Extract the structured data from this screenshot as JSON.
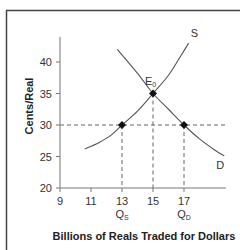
{
  "chart_data": {
    "type": "line",
    "title": "",
    "xlabel": "Billions of Reals Traded for Dollars",
    "ylabel": "Cents/Real",
    "xlim": [
      9,
      19.7
    ],
    "ylim": [
      20,
      44
    ],
    "x_ticks": [
      9,
      11,
      13,
      15,
      17
    ],
    "y_ticks": [
      20,
      25,
      30,
      35,
      40
    ],
    "grid": false,
    "series": [
      {
        "name": "S",
        "label": "S",
        "points": [
          [
            10.6,
            26.2
          ],
          [
            11.5,
            27.2
          ],
          [
            12.3,
            28.4
          ],
          [
            13,
            30
          ],
          [
            14,
            32.2
          ],
          [
            15,
            35
          ],
          [
            16,
            37.9
          ],
          [
            16.8,
            41
          ],
          [
            17.3,
            43
          ]
        ]
      },
      {
        "name": "D",
        "label": "D",
        "points": [
          [
            12.7,
            42
          ],
          [
            14,
            38.2
          ],
          [
            15,
            35
          ],
          [
            16,
            32.5
          ],
          [
            17,
            30
          ],
          [
            18,
            27.8
          ],
          [
            19,
            26
          ],
          [
            19.6,
            25.1
          ]
        ]
      }
    ],
    "annotations": [
      {
        "type": "point",
        "name": "equilibrium",
        "label": "E",
        "label_sub": "0",
        "x": 15,
        "y": 35
      },
      {
        "type": "point",
        "name": "quantity-supplied",
        "x": 13,
        "y": 30
      },
      {
        "type": "point",
        "name": "quantity-demanded",
        "x": 17,
        "y": 30
      },
      {
        "type": "hline",
        "y": 30,
        "style": "dashed"
      },
      {
        "type": "vline",
        "x": 13,
        "y_to": 30,
        "style": "dashed"
      },
      {
        "type": "vline",
        "x": 15,
        "y_to": 35,
        "style": "dashed"
      },
      {
        "type": "vline",
        "x": 17,
        "y_to": 30,
        "style": "dashed"
      }
    ],
    "x_annotations": [
      {
        "x": 13,
        "label": "Q",
        "sub": "S"
      },
      {
        "x": 17,
        "label": "Q",
        "sub": "D"
      }
    ]
  }
}
